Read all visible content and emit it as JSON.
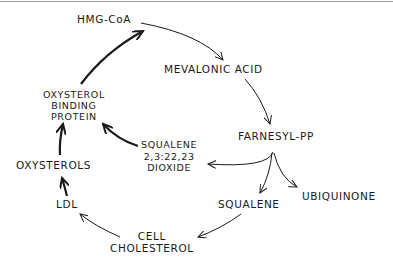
{
  "diagram": {
    "nodes": {
      "hmg_coa": "HMG-CoA",
      "mevalonic_acid": "MEVALONIC ACID",
      "farnesyl_pp": "FARNESYL-PP",
      "squalene": "SQUALENE",
      "ubiquinone": "UBIQUINONE",
      "cell_cholesterol": [
        "CELL",
        "CHOLESTEROL"
      ],
      "ldl": "LDL",
      "oxysterols": "OXYSTEROLS",
      "oxysterol_binding_protein": [
        "OXYSTEROL",
        "BINDING",
        "PROTEIN"
      ],
      "squalene_dioxide": [
        "SQUALENE",
        "2,3:22,23",
        "DIOXIDE"
      ]
    },
    "edges": [
      {
        "from": "HMG-CoA",
        "to": "MEVALONIC ACID",
        "style": "thin"
      },
      {
        "from": "MEVALONIC ACID",
        "to": "FARNESYL-PP",
        "style": "thin"
      },
      {
        "from": "FARNESYL-PP",
        "to": "SQUALENE",
        "style": "thin"
      },
      {
        "from": "FARNESYL-PP",
        "to": "UBIQUINONE",
        "style": "thin"
      },
      {
        "from": "FARNESYL-PP",
        "to": "SQUALENE 2,3:22,23 DIOXIDE",
        "style": "thin"
      },
      {
        "from": "SQUALENE",
        "to": "CELL CHOLESTEROL",
        "style": "thin"
      },
      {
        "from": "CELL CHOLESTEROL",
        "to": "LDL",
        "style": "thin"
      },
      {
        "from": "LDL",
        "to": "OXYSTEROLS",
        "style": "bold"
      },
      {
        "from": "OXYSTEROLS",
        "to": "OXYSTEROL BINDING PROTEIN",
        "style": "bold"
      },
      {
        "from": "SQUALENE 2,3:22,23 DIOXIDE",
        "to": "OXYSTEROL BINDING PROTEIN",
        "style": "bold"
      },
      {
        "from": "OXYSTEROL BINDING PROTEIN",
        "to": "HMG-CoA",
        "style": "bold"
      }
    ],
    "colors": {
      "ink": "#1a1a1a",
      "background": "#ffffff",
      "border": "#9a9a9a"
    }
  }
}
